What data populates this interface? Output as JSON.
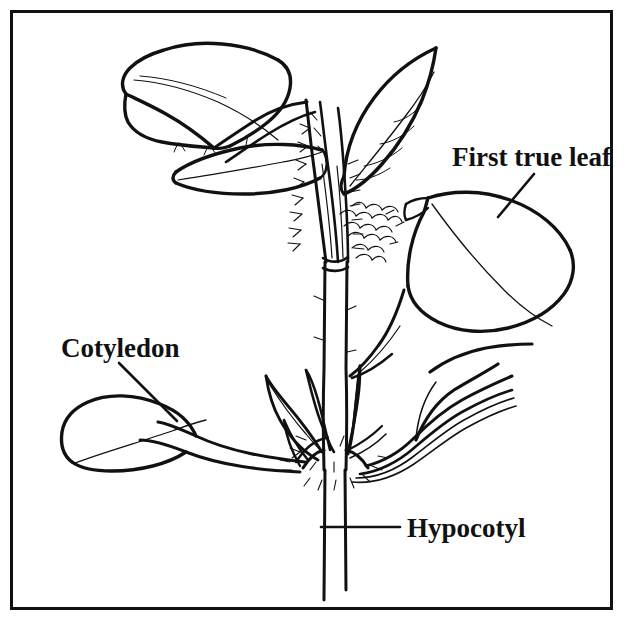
{
  "figure": {
    "kind": "botanical-line-drawing",
    "background_color": "#ffffff",
    "ink_color": "#111111",
    "border": {
      "present": true,
      "color": "#111111",
      "inset_px": 11
    }
  },
  "labels": {
    "first_true_leaf": "First true leaf",
    "cotyledon": "Cotyledon",
    "hypocotyl": "Hypocotyl"
  },
  "leaders": {
    "first_true_leaf": {
      "from_x": 534,
      "from_y": 174,
      "to_x": 498,
      "to_y": 217
    },
    "cotyledon": {
      "from_x": 119,
      "from_y": 363,
      "to_x": 177,
      "to_y": 421
    },
    "hypocotyl": {
      "from_x": 400,
      "from_y": 527,
      "to_x": 321,
      "to_y": 527
    }
  },
  "parts": {
    "hypocotyl_label_target": "lower stem below cotyledon node",
    "cotyledon_label_target": "left seed leaf",
    "first_true_leaf_label_target": "large right true leaf"
  }
}
